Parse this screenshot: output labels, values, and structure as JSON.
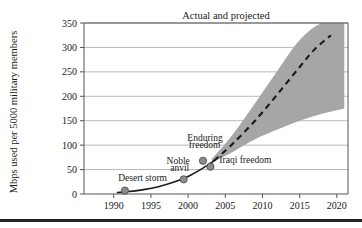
{
  "chart_data": {
    "type": "line",
    "title": "Actual and projected",
    "xlabel": "",
    "ylabel": "Mbps used per 5000 military members",
    "xlim": [
      1986,
      2021.5
    ],
    "ylim": [
      0,
      350
    ],
    "xticks": [
      1990,
      1995,
      2000,
      2005,
      2010,
      2015,
      2020
    ],
    "xtick_labels": [
      "1990",
      "1995",
      "2000",
      "2005",
      "2010",
      "2015",
      "2020"
    ],
    "yticks": [
      0,
      50,
      100,
      150,
      200,
      250,
      300,
      350
    ],
    "ytick_labels": [
      "0",
      "50",
      "100",
      "150",
      "200",
      "250",
      "300",
      "350"
    ],
    "grid": "horizontal",
    "legend": "none",
    "series": [
      {
        "name": "Actual data points",
        "type": "scatter",
        "marker": "circle",
        "color": "#8c8c8c",
        "edge_color": "#4d4d4d",
        "points": [
          {
            "x": 1991.5,
            "y": 7,
            "label": "Desert storm"
          },
          {
            "x": 1999.4,
            "y": 30,
            "label": "Noble anvil"
          },
          {
            "x": 2002.0,
            "y": 68,
            "label": "Enduring freedom"
          },
          {
            "x": 2003.0,
            "y": 56,
            "label": "Iraqi freedom"
          }
        ]
      },
      {
        "name": "Fitted actual curve",
        "type": "line",
        "style": "solid",
        "color": "#1a1a1a",
        "x": [
          1990.5,
          1992,
          1994,
          1996,
          1998,
          2000,
          2002,
          2003.5
        ],
        "y": [
          3,
          5,
          9,
          15,
          24,
          36,
          53,
          68
        ]
      },
      {
        "name": "Projected trend",
        "type": "line",
        "style": "dashed",
        "color": "#1a1a1a",
        "x": [
          2003.5,
          2006,
          2009,
          2012,
          2015,
          2017,
          2019.2
        ],
        "y": [
          68,
          103,
          150,
          204,
          260,
          296,
          325
        ]
      },
      {
        "name": "Projection uncertainty band",
        "type": "area",
        "color": "#a6a6a6",
        "x": [
          2003.2,
          2006,
          2009,
          2012,
          2015,
          2018,
          2021
        ],
        "y_upper": [
          72,
          122,
          186,
          252,
          315,
          350,
          350
        ],
        "y_lower": [
          64,
          86,
          112,
          132,
          150,
          164,
          175
        ]
      }
    ],
    "annotations": [
      {
        "text": "Desert storm",
        "x": 1990.6,
        "y": 26
      },
      {
        "text": "Noble",
        "x": 1997.1,
        "y": 62
      },
      {
        "text": "anvil",
        "x": 1997.6,
        "y": 48
      },
      {
        "text": "Enduring",
        "x": 1999.9,
        "y": 108
      },
      {
        "text": "freedom",
        "x": 2000.1,
        "y": 94
      },
      {
        "text": "Iraqi freedom",
        "x": 2004.2,
        "y": 63
      }
    ]
  },
  "colors": {
    "band": "#a6a6a6",
    "marker_fill": "#8c8c8c",
    "marker_edge": "#4d4d4d",
    "curve": "#1a1a1a",
    "grid": "#9a9a9a",
    "axis": "#555555",
    "rule": "#232323",
    "background": "#ffffff"
  }
}
